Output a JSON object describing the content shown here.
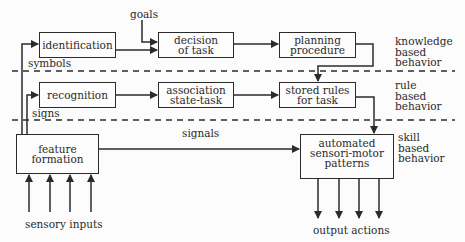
{
  "diagram": {
    "boxes": {
      "identification": "identification",
      "decision": "decision\nof task",
      "planning": "planning\nprocedure",
      "recognition": "recognition",
      "association": "association\nstate-task",
      "stored_rules": "stored rules\nfor task",
      "feature_formation": "feature\nformation",
      "automated": "automated\nsensori-motor\npatterns"
    },
    "labels": {
      "goals": "goals",
      "symbols": "symbols",
      "signs": "signs",
      "signals": "signals",
      "sensory_inputs": "sensory inputs",
      "output_actions": "output actions"
    },
    "levels": [
      {
        "label": "knowledge\nbased\nbehavior"
      },
      {
        "label": "rule\nbased\nbehavior"
      },
      {
        "label": "skill\nbased\nbehavior"
      }
    ]
  }
}
